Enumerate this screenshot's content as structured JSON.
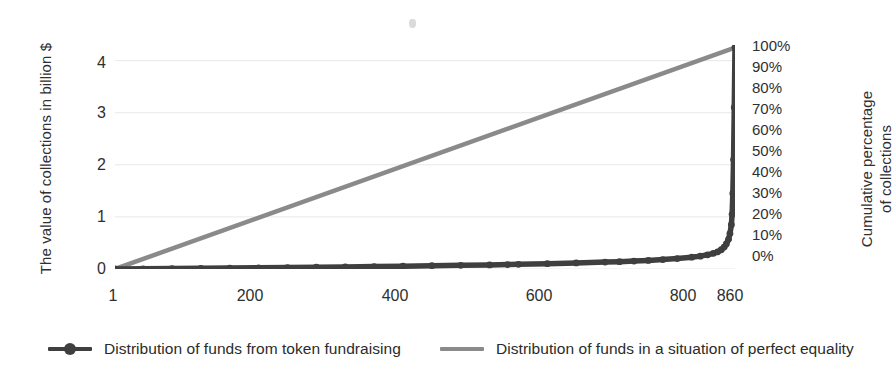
{
  "chart_data": {
    "type": "line",
    "title": "",
    "xlabel": "",
    "ylabel": "The value of collections in billion $",
    "y2label_line1": "Cumulative percentage",
    "y2label_line2": "of collections",
    "xlim": [
      1,
      860
    ],
    "ylim": [
      0,
      4.3
    ],
    "y2lim": [
      0,
      100
    ],
    "grid": true,
    "legend_position": "bottom",
    "x_ticks": [
      "1",
      "200",
      "400",
      "600",
      "800",
      "860"
    ],
    "x_tick_values": [
      1,
      200,
      400,
      600,
      800,
      860
    ],
    "y_ticks": [
      "0",
      "1",
      "2",
      "3",
      "4"
    ],
    "y_tick_values": [
      0,
      1,
      2,
      3,
      4
    ],
    "y2_ticks": [
      "0%",
      "10%",
      "20%",
      "30%",
      "40%",
      "50%",
      "60%",
      "70%",
      "80%",
      "90%",
      "100%"
    ],
    "y2_tick_values": [
      0,
      10,
      20,
      30,
      40,
      50,
      60,
      70,
      80,
      90,
      100
    ],
    "series": [
      {
        "name": "Distribution of funds from token fundraising",
        "color": "#3f3f3f",
        "marker": "circle",
        "x": [
          1,
          40,
          80,
          120,
          160,
          200,
          240,
          280,
          320,
          360,
          400,
          440,
          480,
          520,
          545,
          560,
          600,
          640,
          680,
          700,
          720,
          740,
          760,
          780,
          800,
          812,
          822,
          830,
          836,
          841,
          845,
          848,
          851,
          853,
          855,
          856,
          857,
          858,
          859,
          860
        ],
        "values": [
          0.0,
          0.004,
          0.008,
          0.013,
          0.018,
          0.023,
          0.028,
          0.034,
          0.04,
          0.047,
          0.054,
          0.062,
          0.07,
          0.079,
          0.085,
          0.09,
          0.102,
          0.116,
          0.132,
          0.141,
          0.152,
          0.165,
          0.181,
          0.201,
          0.227,
          0.247,
          0.272,
          0.3,
          0.33,
          0.37,
          0.42,
          0.48,
          0.57,
          0.68,
          0.85,
          1.05,
          1.45,
          2.1,
          3.1,
          4.25
        ]
      },
      {
        "name": "Distribution of funds in a situation of perfect equality",
        "color": "#8a8a8a",
        "marker": "none",
        "x": [
          1,
          860
        ],
        "values": [
          0.0,
          4.25
        ]
      }
    ]
  },
  "legend": {
    "items": [
      {
        "label": "Distribution of funds from token fundraising",
        "color": "#3f3f3f",
        "has_marker": true
      },
      {
        "label": "Distribution of funds in a situation of perfect equality",
        "color": "#8a8a8a",
        "has_marker": false
      }
    ]
  },
  "colors": {
    "series_dark": "#3f3f3f",
    "series_gray": "#8a8a8a",
    "grid": "#e8e8e8",
    "text": "#2f2f2f",
    "background": "#ffffff"
  }
}
